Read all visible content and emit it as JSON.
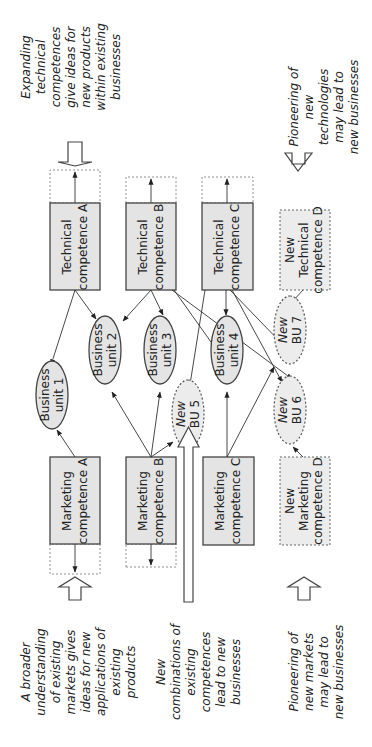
{
  "diagram": {
    "technical": [
      {
        "l1": "Technical",
        "l2": "competence A"
      },
      {
        "l1": "Technical",
        "l2": "competence B"
      },
      {
        "l1": "Technical",
        "l2": "competence C"
      },
      {
        "l0": "New",
        "l1": "Technical",
        "l2": "competence D"
      }
    ],
    "marketing": [
      {
        "l1": "Marketing",
        "l2": "competence A"
      },
      {
        "l1": "Marketing",
        "l2": "competence B"
      },
      {
        "l1": "Marketing",
        "l2": "competence C"
      },
      {
        "l0": "New",
        "l1": "Marketing",
        "l2": "competence D"
      }
    ],
    "units": [
      {
        "l1": "Business",
        "l2": "unit 1"
      },
      {
        "l1": "Business",
        "l2": "unit 2"
      },
      {
        "l1": "Business",
        "l2": "unit 3"
      },
      {
        "l1": "Business",
        "l2": "unit 4"
      },
      {
        "l1": "New",
        "l2": "BU 5"
      },
      {
        "l1": "New",
        "l2": "BU 6"
      },
      {
        "l1": "New",
        "l2": "BU 7"
      }
    ],
    "annotations": {
      "tech_expand": [
        "Expanding",
        "technical",
        "competences",
        "give ideas for",
        "new products",
        "within existing",
        "businesses"
      ],
      "tech_pioneer": [
        "Pioneering of",
        "new",
        "technologies",
        "may lead to",
        "new businesses"
      ],
      "mkt_broad": [
        "A broader",
        "understanding",
        "of existing",
        "markets gives",
        "ideas for new",
        "applications of",
        "existing",
        "products"
      ],
      "mkt_combine": [
        "New",
        "combinations of",
        "existing",
        "competences",
        "lead to new",
        "businesses"
      ],
      "mkt_pioneer": [
        "Pioneering of",
        "new markets",
        "may lead to",
        "new businesses"
      ]
    }
  }
}
